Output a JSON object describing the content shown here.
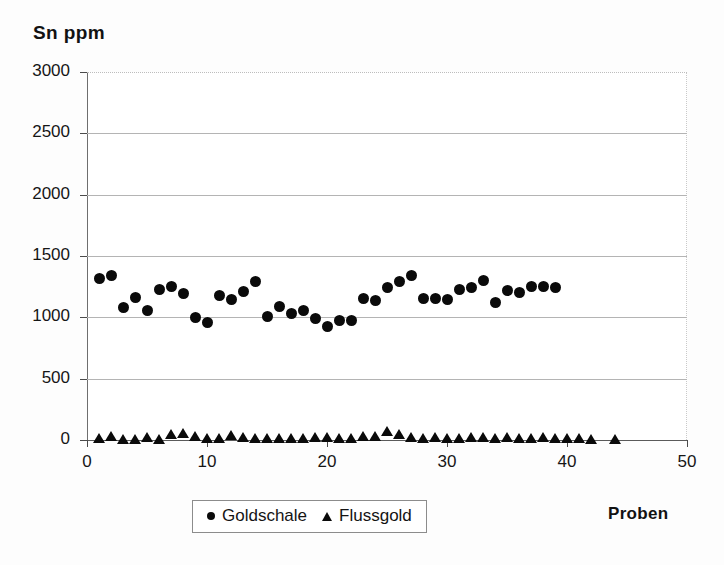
{
  "chart_data": {
    "type": "scatter",
    "title": "Sn ppm",
    "xlabel": "Proben",
    "ylabel": "",
    "xlim": [
      0,
      50
    ],
    "ylim": [
      0,
      3000
    ],
    "xticks": [
      0,
      10,
      20,
      30,
      40,
      50
    ],
    "yticks": [
      0,
      500,
      1000,
      1500,
      2000,
      2500,
      3000
    ],
    "grid": "horizontal",
    "legend_position": "bottom-center",
    "series": [
      {
        "name": "Goldschale",
        "marker": "circle",
        "color": "#0a0a0a",
        "x": [
          1,
          2,
          3,
          4,
          5,
          6,
          7,
          8,
          9,
          10,
          11,
          12,
          13,
          14,
          15,
          16,
          17,
          18,
          19,
          20,
          21,
          22,
          23,
          24,
          25,
          26,
          27,
          28,
          29,
          30,
          31,
          32,
          33,
          34,
          35,
          36,
          37,
          38,
          39
        ],
        "y": [
          1315,
          1340,
          1080,
          1160,
          1055,
          1230,
          1250,
          1195,
          1000,
          960,
          1180,
          1145,
          1210,
          1290,
          1005,
          1085,
          1035,
          1055,
          990,
          925,
          975,
          975,
          1150,
          1135,
          1240,
          1290,
          1340,
          1150,
          1155,
          1145,
          1225,
          1240,
          1300,
          1125,
          1215,
          1205,
          1250,
          1255,
          1245
        ]
      },
      {
        "name": "Flussgold",
        "marker": "triangle",
        "color": "#0a0a0a",
        "x": [
          1,
          2,
          3,
          4,
          5,
          6,
          7,
          8,
          9,
          10,
          11,
          12,
          13,
          14,
          15,
          16,
          17,
          18,
          19,
          20,
          21,
          22,
          23,
          24,
          25,
          26,
          27,
          28,
          29,
          30,
          31,
          32,
          33,
          34,
          35,
          36,
          37,
          38,
          39,
          40,
          41,
          42,
          44
        ],
        "y": [
          15,
          30,
          10,
          8,
          25,
          12,
          45,
          55,
          35,
          20,
          18,
          40,
          22,
          18,
          16,
          20,
          15,
          18,
          22,
          25,
          20,
          18,
          30,
          35,
          70,
          45,
          25,
          20,
          22,
          18,
          20,
          24,
          22,
          18,
          25,
          20,
          18,
          22,
          20,
          15,
          18,
          12,
          10
        ]
      }
    ]
  },
  "legend": {
    "entries": [
      {
        "label": "Goldschale",
        "marker": "circle-marker-icon"
      },
      {
        "label": "Flussgold",
        "marker": "triangle-marker-icon"
      }
    ]
  }
}
